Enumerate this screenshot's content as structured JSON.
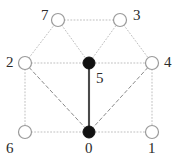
{
  "figure": {
    "kind": "undirected-graph-diagram",
    "width": 180,
    "height": 161,
    "background": "#ffffff"
  },
  "style": {
    "dotted_edge_color": "#bfbfbf",
    "dashed_edge_color": "#8a8a8a",
    "solid_edge_color": "#4a4a4a",
    "open_node_stroke": "#9a9a9a",
    "open_node_fill": "#ffffff",
    "filled_node_fill": "#111111",
    "label_color": "#2b2b2b",
    "node_radius": 6.5,
    "filled_node_radius": 6.0
  },
  "nodes": [
    {
      "id": "0",
      "label": "0",
      "x": 89,
      "y": 132,
      "fill": "filled",
      "label_x": 85,
      "label_y": 141
    },
    {
      "id": "1",
      "label": "1",
      "x": 152,
      "y": 132,
      "fill": "open",
      "label_x": 148,
      "label_y": 141
    },
    {
      "id": "2",
      "label": "2",
      "x": 25,
      "y": 63,
      "fill": "open",
      "label_x": 6,
      "label_y": 55
    },
    {
      "id": "3",
      "label": "3",
      "x": 120,
      "y": 20,
      "fill": "open",
      "label_x": 133,
      "label_y": 8
    },
    {
      "id": "4",
      "label": "4",
      "x": 152,
      "y": 63,
      "fill": "open",
      "label_x": 164,
      "label_y": 55
    },
    {
      "id": "5",
      "label": "5",
      "x": 89,
      "y": 63,
      "fill": "filled",
      "label_x": 96,
      "label_y": 71
    },
    {
      "id": "6",
      "label": "6",
      "x": 25,
      "y": 132,
      "fill": "open",
      "label_x": 6,
      "label_y": 141
    },
    {
      "id": "7",
      "label": "7",
      "x": 58,
      "y": 20,
      "fill": "open",
      "label_x": 41,
      "label_y": 8
    }
  ],
  "edges": [
    {
      "from": "7",
      "to": "3",
      "style": "dotted"
    },
    {
      "from": "2",
      "to": "7",
      "style": "dotted"
    },
    {
      "from": "7",
      "to": "5",
      "style": "dotted"
    },
    {
      "from": "5",
      "to": "3",
      "style": "dotted"
    },
    {
      "from": "3",
      "to": "4",
      "style": "dotted"
    },
    {
      "from": "2",
      "to": "5",
      "style": "dotted"
    },
    {
      "from": "5",
      "to": "4",
      "style": "dotted"
    },
    {
      "from": "2",
      "to": "6",
      "style": "dotted"
    },
    {
      "from": "4",
      "to": "1",
      "style": "dotted"
    },
    {
      "from": "6",
      "to": "0",
      "style": "dotted"
    },
    {
      "from": "0",
      "to": "1",
      "style": "dotted"
    },
    {
      "from": "2",
      "to": "0",
      "style": "dashed"
    },
    {
      "from": "4",
      "to": "0",
      "style": "dashed"
    },
    {
      "from": "5",
      "to": "0",
      "style": "solid"
    }
  ]
}
